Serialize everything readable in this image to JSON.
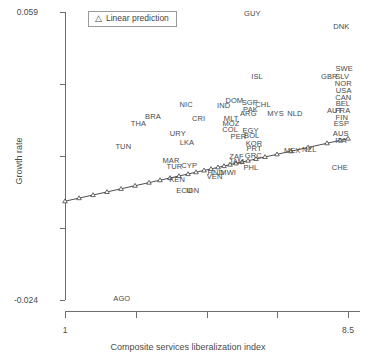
{
  "chart_data": {
    "type": "scatter",
    "title": "",
    "xlabel": "Composite services liberalization index",
    "ylabel": "Growth rate",
    "xlim": [
      1,
      8.5
    ],
    "ylim": [
      -0.024,
      0.059
    ],
    "xticks": [
      "1",
      "8.5"
    ],
    "yticks": [
      "0.059",
      "-0.024"
    ],
    "grid": false,
    "legend": {
      "position": "top-left-inside",
      "glyph": "△",
      "label": "Linear prediction"
    },
    "series": [
      {
        "name": "Country observations",
        "kind": "text-labels",
        "points": [
          {
            "label": "GUY",
            "x": 5.95,
            "y": 0.0585
          },
          {
            "label": "DNK",
            "x": 8.3,
            "y": 0.0548
          },
          {
            "label": "SWE",
            "x": 8.37,
            "y": 0.0425
          },
          {
            "label": "GBR",
            "x": 7.98,
            "y": 0.0403
          },
          {
            "label": "SLV",
            "x": 8.32,
            "y": 0.0403
          },
          {
            "label": "NOR",
            "x": 8.35,
            "y": 0.0382
          },
          {
            "label": "USA",
            "x": 8.36,
            "y": 0.0363
          },
          {
            "label": "CAN",
            "x": 8.35,
            "y": 0.0343
          },
          {
            "label": "BEL",
            "x": 8.34,
            "y": 0.0324
          },
          {
            "label": "AUT",
            "x": 8.12,
            "y": 0.0305
          },
          {
            "label": "FRA",
            "x": 8.33,
            "y": 0.0305
          },
          {
            "label": "FIN",
            "x": 8.31,
            "y": 0.0286
          },
          {
            "label": "ESP",
            "x": 8.3,
            "y": 0.0267
          },
          {
            "label": "AUS",
            "x": 8.28,
            "y": 0.0238
          },
          {
            "label": "ITA",
            "x": 8.29,
            "y": 0.0219
          },
          {
            "label": "ISL",
            "x": 6.07,
            "y": 0.0404
          },
          {
            "label": "NIC",
            "x": 4.2,
            "y": 0.0323
          },
          {
            "label": "DOM",
            "x": 5.47,
            "y": 0.0333
          },
          {
            "label": "IND",
            "x": 5.19,
            "y": 0.032
          },
          {
            "label": "SGP",
            "x": 5.88,
            "y": 0.0327
          },
          {
            "label": "CHL",
            "x": 6.23,
            "y": 0.0322
          },
          {
            "label": "PAK",
            "x": 5.9,
            "y": 0.0308
          },
          {
            "label": "ARG",
            "x": 5.84,
            "y": 0.0297
          },
          {
            "label": "MYS",
            "x": 6.56,
            "y": 0.0296
          },
          {
            "label": "NLD",
            "x": 7.07,
            "y": 0.0297
          },
          {
            "label": "BRA",
            "x": 3.32,
            "y": 0.0287
          },
          {
            "label": "CRI",
            "x": 4.53,
            "y": 0.0281
          },
          {
            "label": "MLT",
            "x": 5.39,
            "y": 0.0283
          },
          {
            "label": "MOZ",
            "x": 5.38,
            "y": 0.0266
          },
          {
            "label": "THA",
            "x": 2.94,
            "y": 0.0266
          },
          {
            "label": "COL",
            "x": 5.36,
            "y": 0.0249
          },
          {
            "label": "EGY",
            "x": 5.9,
            "y": 0.0248
          },
          {
            "label": "URY",
            "x": 3.98,
            "y": 0.0238
          },
          {
            "label": "PER",
            "x": 5.58,
            "y": 0.0231
          },
          {
            "label": "BOL",
            "x": 5.93,
            "y": 0.0232
          },
          {
            "label": "KOR",
            "x": 5.99,
            "y": 0.0211
          },
          {
            "label": "LKA",
            "x": 4.22,
            "y": 0.0213
          },
          {
            "label": "PRT",
            "x": 5.99,
            "y": 0.0196
          },
          {
            "label": "TUN",
            "x": 2.54,
            "y": 0.0201
          },
          {
            "label": "MEX",
            "x": 7.0,
            "y": 0.019
          },
          {
            "label": "NZL",
            "x": 7.45,
            "y": 0.0192
          },
          {
            "label": "ZAF",
            "x": 5.53,
            "y": 0.0172
          },
          {
            "label": "GRC",
            "x": 5.97,
            "y": 0.0174
          },
          {
            "label": "JAM",
            "x": 5.53,
            "y": 0.0159
          },
          {
            "label": "MAR",
            "x": 3.8,
            "y": 0.0162
          },
          {
            "label": "TUR",
            "x": 3.89,
            "y": 0.0143
          },
          {
            "label": "CYP",
            "x": 4.28,
            "y": 0.0145
          },
          {
            "label": "PHL",
            "x": 5.91,
            "y": 0.0141
          },
          {
            "label": "CHE",
            "x": 8.26,
            "y": 0.014
          },
          {
            "label": "HND",
            "x": 4.98,
            "y": 0.0127
          },
          {
            "label": "MWI",
            "x": 5.31,
            "y": 0.0127
          },
          {
            "label": "VEN",
            "x": 4.95,
            "y": 0.0114
          },
          {
            "label": "KEN",
            "x": 3.96,
            "y": 0.0105
          },
          {
            "label": "ECU",
            "x": 4.15,
            "y": 0.0073
          },
          {
            "label": "IDN",
            "x": 4.37,
            "y": 0.0073
          },
          {
            "label": "AGO",
            "x": 2.5,
            "y": -0.0236
          }
        ]
      },
      {
        "name": "Linear prediction",
        "kind": "line-with-markers",
        "marker": "triangle",
        "x_start": 1.0,
        "x_end": 8.5,
        "y_start": 0.0123,
        "y_end": 0.0304
      }
    ]
  },
  "axes": {
    "y_title": "Growth rate",
    "x_title": "Composite services liberalization index",
    "y_tick_top": "0.059",
    "y_tick_bottom": "-0.024",
    "x_tick_left": "1",
    "x_tick_right": "8.5"
  },
  "legend": {
    "glyph": "△",
    "text": "Linear prediction"
  },
  "colors": {
    "background": "#ffffff",
    "axis": "#6e6e6e",
    "text": "#4a4a4a",
    "line": "#3a3a3a",
    "marker_fill": "#ffffff"
  }
}
